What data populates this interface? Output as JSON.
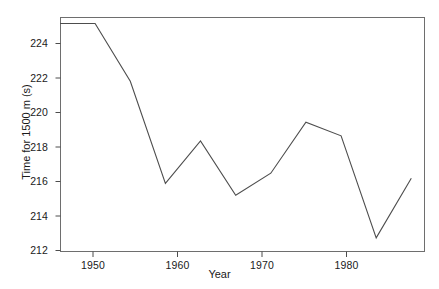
{
  "chart_data": {
    "type": "line",
    "title": "",
    "xlabel": "Year",
    "ylabel": "Time for 1500 m (s)",
    "x": [
      1948,
      1952,
      1956,
      1960,
      1964,
      1968,
      1972,
      1976,
      1980,
      1984,
      1988
    ],
    "values": [
      225.0,
      225.0,
      221.6,
      215.6,
      218.1,
      214.9,
      216.2,
      219.2,
      218.4,
      212.4,
      215.9
    ],
    "series": [
      {
        "name": "Time for 1500 m (s)",
        "values": [
          225.0,
          225.0,
          221.6,
          215.6,
          218.1,
          214.9,
          216.2,
          219.2,
          218.4,
          212.4,
          215.9
        ]
      }
    ],
    "xlim": [
      1948,
      1989.5
    ],
    "ylim": [
      211.6,
      225.35
    ],
    "xticks": [
      1950,
      1960,
      1970,
      1980
    ],
    "yticks": [
      212,
      214,
      216,
      218,
      220,
      222,
      224
    ],
    "xtick_labels": [
      "1950",
      "1960",
      "1970",
      "1980"
    ],
    "ytick_labels": [
      "212",
      "214",
      "216",
      "218",
      "220",
      "222",
      "224"
    ],
    "grid": false,
    "legend": null,
    "legend_position": "none",
    "line_color": "#4d4d4d",
    "frame_color": "#6e6e6e",
    "background": "#ffffff"
  },
  "axes": {
    "x_title": "Year",
    "y_title": "Time for 1500 m (s)"
  }
}
